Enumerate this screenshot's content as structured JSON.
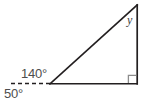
{
  "figure": {
    "canvas": {
      "width": 148,
      "height": 105,
      "background": "#ffffff"
    },
    "stroke_color": "#231f20",
    "text_color": "#4d4d4d",
    "labels": {
      "exterior_angle": "140°",
      "supplement_angle": "50°",
      "apex_angle": "y"
    },
    "markers": {
      "right_angle": "right-angle-square"
    },
    "vertices": {
      "left": [
        50,
        84
      ],
      "bottom_right": [
        137,
        84
      ],
      "apex": [
        137,
        5
      ]
    },
    "dashed_ray": {
      "from": [
        50,
        84
      ],
      "to": [
        8,
        83
      ],
      "dash": "4 3"
    }
  }
}
